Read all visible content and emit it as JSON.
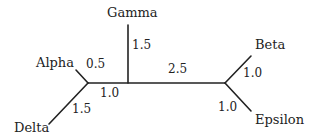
{
  "diagram": {
    "type": "unrooted phylogenetic tree",
    "taxa": [
      {
        "name": "Alpha",
        "branch_length": "0.5"
      },
      {
        "name": "Beta",
        "branch_length": "1.0"
      },
      {
        "name": "Gamma",
        "branch_length": "1.5"
      },
      {
        "name": "Delta",
        "branch_length": "1.5"
      },
      {
        "name": "Epsilon",
        "branch_length": "1.0"
      }
    ],
    "internal_edges": [
      {
        "from": "Alpha/Delta node",
        "to": "Gamma junction",
        "length": "1.0"
      },
      {
        "from": "Gamma junction",
        "to": "Beta/Epsilon node",
        "length": "2.5"
      }
    ]
  },
  "labels": {
    "alpha": "Alpha",
    "beta": "Beta",
    "gamma": "Gamma",
    "delta": "Delta",
    "epsilon": "Epsilon"
  },
  "lengths": {
    "alpha": "0.5",
    "gamma": "1.5",
    "delta": "1.5",
    "beta": "1.0",
    "epsilon": "1.0",
    "internal_left": "1.0",
    "internal_right": "2.5"
  }
}
